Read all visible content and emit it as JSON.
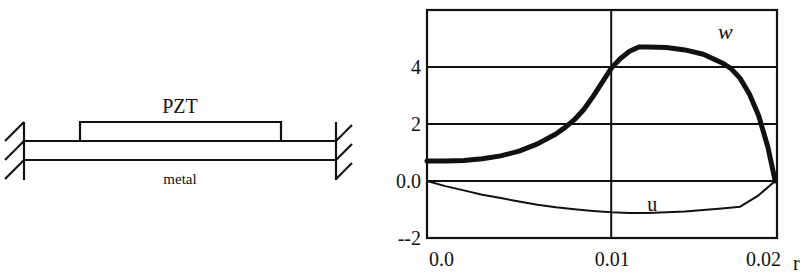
{
  "diagram": {
    "layer_top_label": "PZT",
    "layer_bottom_label": "metal",
    "supports": "clamped-both-ends"
  },
  "chart_data": {
    "type": "line",
    "title": "",
    "xlabel": "r",
    "ylabel": "",
    "xlim": [
      0,
      0.019
    ],
    "ylim": [
      -2,
      6
    ],
    "grid": true,
    "x_ticks": [
      {
        "value": 0.0,
        "label": "0.0"
      },
      {
        "value": 0.01,
        "label": "0.01"
      },
      {
        "value": 0.019,
        "label": "0.02"
      }
    ],
    "y_ticks": [
      {
        "value": 4,
        "label": "4"
      },
      {
        "value": 2,
        "label": "2"
      },
      {
        "value": 0,
        "label": "0.0"
      },
      {
        "value": -2,
        "label": "--2"
      }
    ],
    "series": [
      {
        "name": "w",
        "style": "thick",
        "x": [
          0.0,
          0.001,
          0.002,
          0.003,
          0.004,
          0.005,
          0.006,
          0.007,
          0.0075,
          0.008,
          0.0085,
          0.009,
          0.0095,
          0.01,
          0.0105,
          0.011,
          0.0115,
          0.012,
          0.013,
          0.014,
          0.015,
          0.016,
          0.0165,
          0.017,
          0.0175,
          0.018,
          0.0185,
          0.0189
        ],
        "values": [
          0.7,
          0.7,
          0.72,
          0.78,
          0.88,
          1.05,
          1.3,
          1.65,
          1.88,
          2.15,
          2.5,
          2.95,
          3.45,
          3.95,
          4.3,
          4.55,
          4.7,
          4.7,
          4.68,
          4.6,
          4.45,
          4.15,
          3.95,
          3.6,
          3.05,
          2.3,
          1.2,
          0.0
        ]
      },
      {
        "name": "u",
        "style": "thin",
        "x": [
          0.0,
          0.001,
          0.002,
          0.003,
          0.004,
          0.005,
          0.006,
          0.007,
          0.008,
          0.009,
          0.01,
          0.011,
          0.012,
          0.013,
          0.014,
          0.015,
          0.016,
          0.017,
          0.018,
          0.0189
        ],
        "values": [
          0.0,
          -0.18,
          -0.33,
          -0.48,
          -0.6,
          -0.72,
          -0.83,
          -0.92,
          -0.99,
          -1.05,
          -1.1,
          -1.12,
          -1.12,
          -1.1,
          -1.07,
          -1.02,
          -0.97,
          -0.9,
          -0.5,
          0.0
        ]
      }
    ],
    "annotations": [
      {
        "text": "w",
        "x": 0.0158,
        "y": 5.0,
        "italic": true
      },
      {
        "text": "u",
        "x": 0.01195,
        "y": -1.05,
        "italic": false
      }
    ]
  }
}
